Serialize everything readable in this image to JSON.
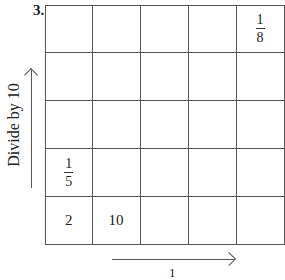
{
  "problem": {
    "number": "3.",
    "vertical_label": "Divide by 10",
    "horizontal_label_partial": "1"
  },
  "grid": {
    "rows": 5,
    "cols": 5,
    "cells": [
      [
        "",
        "",
        "",
        "",
        {
          "num": "1",
          "den": "8"
        }
      ],
      [
        "",
        "",
        "",
        "",
        ""
      ],
      [
        "",
        "",
        "",
        "",
        ""
      ],
      [
        {
          "num": "1",
          "den": "5"
        },
        "",
        "",
        "",
        ""
      ],
      [
        "2",
        "10",
        "",
        "",
        ""
      ]
    ]
  }
}
